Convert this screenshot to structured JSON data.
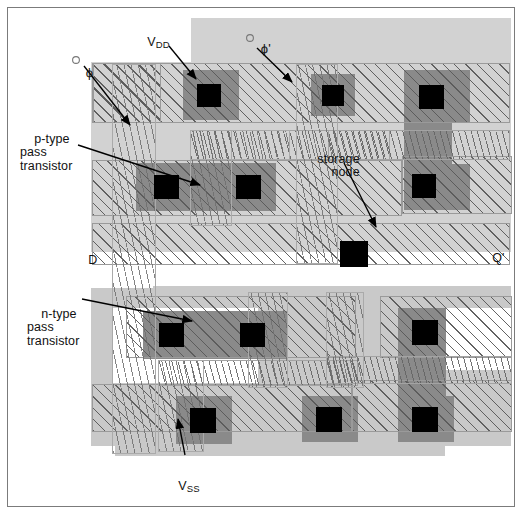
{
  "figure": {
    "background": "#ffffff",
    "frame_color": "#7b7b7b",
    "width": 524,
    "height": 516
  },
  "palette": {
    "well_light_gray": "#d2d2d2",
    "well_gray": "#c9c9c9",
    "diffusion_dark_gray": "#8a8a8a",
    "contact_black": "#000000",
    "hatch_line": "#5a5a5a",
    "outline": "#9a9a9a",
    "text": "#111111"
  },
  "annotations": [
    {
      "id": "vdd",
      "text": "V",
      "sub": "DD",
      "x": 133,
      "y": 22,
      "name": "label-vdd"
    },
    {
      "id": "phi",
      "text": "ϕ",
      "sub": "",
      "x": 71,
      "y": 52,
      "name": "label-phi"
    },
    {
      "id": "phi_prime",
      "text": "ϕ'",
      "sub": "",
      "x": 246,
      "y": 28,
      "name": "label-phi-prime"
    },
    {
      "id": "ptype",
      "text": "p-type\npass\ntransistor",
      "sub": "",
      "x": 20,
      "y": 119,
      "name": "label-p-type-pass-transistor"
    },
    {
      "id": "storage",
      "text": "storage\nnode",
      "sub": "",
      "x": 303,
      "y": 139,
      "name": "label-storage-node"
    },
    {
      "id": "d",
      "text": "D",
      "sub": "",
      "x": 74,
      "y": 240,
      "name": "label-d"
    },
    {
      "id": "qprime",
      "text": "Q'",
      "sub": "",
      "x": 478,
      "y": 238,
      "name": "label-q-prime"
    },
    {
      "id": "ntype",
      "text": "n-type\npass\ntransistor",
      "sub": "",
      "x": 27,
      "y": 294,
      "name": "label-n-type-pass-transistor"
    },
    {
      "id": "vss",
      "text": "V",
      "sub": "SS",
      "x": 164,
      "y": 466,
      "name": "label-vss"
    }
  ],
  "leaders": [
    {
      "from": [
        169,
        46
      ],
      "to": [
        196,
        79
      ],
      "name": "leader-vdd"
    },
    {
      "from": [
        84,
        66
      ],
      "to": [
        130,
        125
      ],
      "name": "leader-phi"
    },
    {
      "from": [
        257,
        48
      ],
      "to": [
        292,
        82
      ],
      "name": "leader-phi-prime"
    },
    {
      "from": [
        78,
        145
      ],
      "to": [
        200,
        185
      ],
      "name": "leader-p-type"
    },
    {
      "from": [
        344,
        163
      ],
      "to": [
        376,
        227
      ],
      "name": "leader-storage-node"
    },
    {
      "from": [
        82,
        299
      ],
      "to": [
        192,
        321
      ],
      "name": "leader-n-type"
    },
    {
      "from": [
        185,
        455
      ],
      "to": [
        178,
        419
      ],
      "name": "leader-vss"
    }
  ],
  "layers": {
    "names": [
      "n-well",
      "p-well",
      "diffusion",
      "polysilicon",
      "metal-1",
      "metal-2",
      "contact-cut"
    ]
  }
}
